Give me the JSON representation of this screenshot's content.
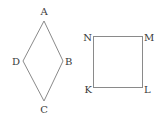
{
  "figures": [
    {
      "name": "rhombus",
      "shape": "rhombus",
      "vertices": [
        "A",
        "B",
        "C",
        "D"
      ]
    },
    {
      "name": "square",
      "shape": "square",
      "vertices": [
        "K",
        "L",
        "M",
        "N"
      ]
    }
  ],
  "labels": {
    "A": "A",
    "B": "B",
    "C": "C",
    "D": "D",
    "K": "K",
    "L": "L",
    "M": "M",
    "N": "N"
  },
  "colors": {
    "line": "#8a8a8a",
    "text": "#3a3a3a",
    "background": "#ffffff"
  }
}
